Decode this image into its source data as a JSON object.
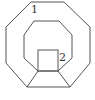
{
  "diagram": {
    "type": "geometric-figure",
    "stroke_color": "#555555",
    "background": "#ffffff",
    "labels": [
      {
        "id": "region-1",
        "text": "1"
      },
      {
        "id": "region-2",
        "text": "2"
      }
    ],
    "shapes": {
      "outer_octagon": [
        [
          31,
          2
        ],
        [
          64,
          2
        ],
        [
          90,
          27
        ],
        [
          90,
          63
        ],
        [
          70,
          87
        ],
        [
          27,
          87
        ],
        [
          6,
          63
        ],
        [
          6,
          27
        ]
      ],
      "inner_octagon": [
        [
          34,
          21
        ],
        [
          59,
          21
        ],
        [
          72,
          35
        ],
        [
          72,
          58
        ],
        [
          58,
          71
        ],
        [
          38,
          71
        ],
        [
          24,
          58
        ],
        [
          24,
          35
        ]
      ],
      "square": {
        "x": 38,
        "y": 50,
        "width": 20,
        "height": 21
      },
      "connectors": [
        [
          [
            38,
            71
          ],
          [
            27,
            87
          ]
        ],
        [
          [
            58,
            71
          ],
          [
            70,
            87
          ]
        ]
      ]
    }
  }
}
